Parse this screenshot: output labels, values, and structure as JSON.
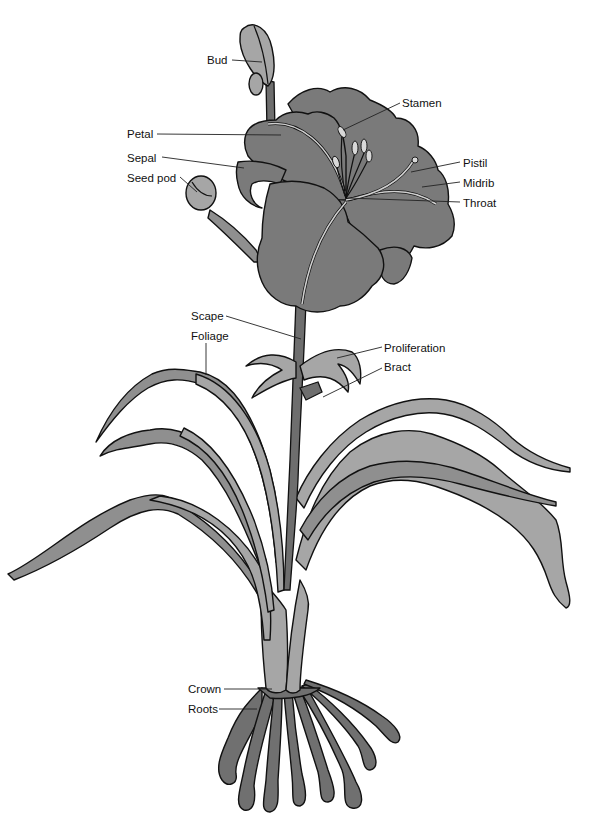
{
  "diagram": {
    "colors": {
      "background": "#ffffff",
      "petal_fill": "#7a7a7a",
      "leaf_fill": "#a6a6a6",
      "root_fill": "#707070",
      "outline": "#111111"
    },
    "labels": [
      {
        "id": "bud",
        "text": "Bud",
        "x": 207,
        "y": 53,
        "points_to": [
          262,
          62
        ]
      },
      {
        "id": "stamen",
        "text": "Stamen",
        "x": 402,
        "y": 96,
        "points_to": [
          343,
          130
        ]
      },
      {
        "id": "petal",
        "text": "Petal",
        "x": 127,
        "y": 127,
        "points_to": [
          281,
          135
        ]
      },
      {
        "id": "sepal",
        "text": "Sepal",
        "x": 127,
        "y": 151,
        "points_to": [
          244,
          168
        ]
      },
      {
        "id": "seed_pod",
        "text": "Seed pod",
        "x": 127,
        "y": 171,
        "points_to": [
          197,
          192
        ]
      },
      {
        "id": "pistil",
        "text": "Pistil",
        "x": 463,
        "y": 156,
        "points_to": [
          411,
          172
        ]
      },
      {
        "id": "midrib",
        "text": "Midrib",
        "x": 463,
        "y": 176,
        "points_to": [
          422,
          187
        ]
      },
      {
        "id": "throat",
        "text": "Throat",
        "x": 463,
        "y": 196,
        "points_to": [
          347,
          198
        ]
      },
      {
        "id": "scape",
        "text": "Scape",
        "x": 191,
        "y": 309,
        "points_to": [
          301,
          339
        ]
      },
      {
        "id": "foliage",
        "text": "Foliage",
        "x": 191,
        "y": 329,
        "points_to": [
          206,
          375
        ]
      },
      {
        "id": "proliferation",
        "text": "Proliferation",
        "x": 384,
        "y": 341,
        "points_to": [
          337,
          358
        ]
      },
      {
        "id": "bract",
        "text": "Bract",
        "x": 384,
        "y": 360,
        "points_to": [
          323,
          397
        ]
      },
      {
        "id": "crown",
        "text": "Crown",
        "x": 188,
        "y": 682,
        "points_to": [
          272,
          689
        ]
      },
      {
        "id": "roots",
        "text": "Roots",
        "x": 188,
        "y": 702,
        "points_to": [
          257,
          709
        ]
      }
    ]
  }
}
